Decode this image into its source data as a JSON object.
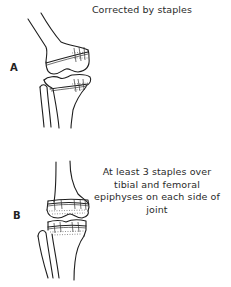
{
  "figure": {
    "panel_a": {
      "label": "A",
      "caption": "Corrected by staples"
    },
    "panel_b": {
      "label": "B",
      "caption": "At least 3 staples over tibial and femoral epiphyses on each side of joint"
    }
  }
}
